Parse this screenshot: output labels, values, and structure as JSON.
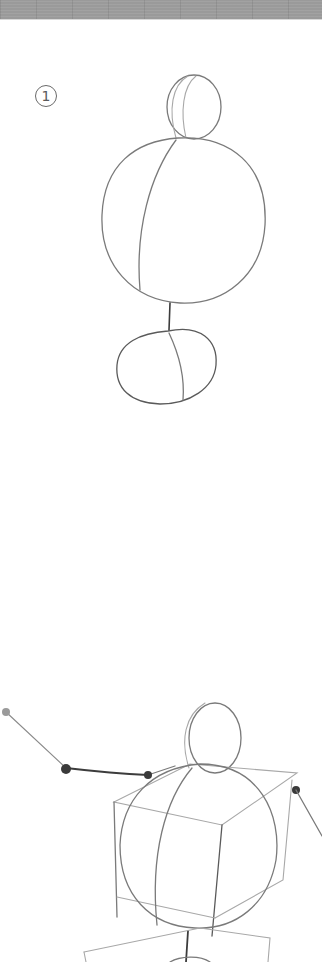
{
  "page": {
    "header_band": {
      "pattern": "grey-greek-key-strip",
      "color": "#9a9a9a"
    },
    "steps": [
      {
        "number": "1",
        "label": "①",
        "figure": "head-circle-over-large-body-circle-and-pelvis-oval"
      },
      {
        "figure": "head-circle-with-box-torso-and-outstretched-arm-with-joints"
      }
    ],
    "colors": {
      "background": "#ffffff",
      "pencil": "#7a7a7a",
      "pencil_dark": "#3c3c3c",
      "badge": "#6a6a6a"
    }
  }
}
